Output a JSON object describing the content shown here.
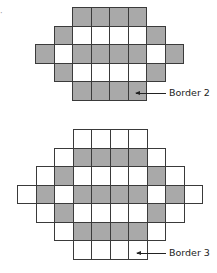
{
  "figures": [
    {
      "id": "border-2",
      "label": "Border 2",
      "origin": {
        "x": 35,
        "y": 7
      },
      "cell_size": 18.5,
      "rows": [
        [
          null,
          null,
          "g",
          "g",
          "g",
          "g",
          null,
          null
        ],
        [
          null,
          "g",
          "w",
          "w",
          "w",
          "w",
          "g",
          null
        ],
        [
          "g",
          "w",
          "g",
          "g",
          "g",
          "g",
          "w",
          "g"
        ],
        [
          null,
          "g",
          "w",
          "w",
          "w",
          "w",
          "g",
          null
        ],
        [
          null,
          null,
          "g",
          "g",
          "g",
          "g",
          null,
          null
        ]
      ],
      "arrow": {
        "x": 136,
        "y": 93,
        "width": 30
      },
      "label_pos": {
        "x": 169,
        "y": 87
      }
    },
    {
      "id": "border-3",
      "label": "Border 3",
      "origin": {
        "x": 17,
        "y": 129
      },
      "cell_size": 18.5,
      "rows": [
        [
          null,
          null,
          null,
          "w",
          "w",
          "w",
          "w",
          null,
          null,
          null
        ],
        [
          null,
          null,
          "w",
          "g",
          "g",
          "g",
          "g",
          "w",
          null,
          null
        ],
        [
          null,
          "w",
          "g",
          "w",
          "w",
          "w",
          "w",
          "g",
          "w",
          null
        ],
        [
          "w",
          "g",
          "w",
          "g",
          "g",
          "g",
          "g",
          "w",
          "g",
          "w"
        ],
        [
          null,
          "w",
          "g",
          "w",
          "w",
          "w",
          "w",
          "g",
          "w",
          null
        ],
        [
          null,
          null,
          "w",
          "g",
          "g",
          "g",
          "g",
          "w",
          null,
          null
        ],
        [
          null,
          null,
          null,
          "w",
          "w",
          "w",
          "w",
          null,
          null,
          null
        ]
      ],
      "arrow": {
        "x": 137,
        "y": 253,
        "width": 29
      },
      "label_pos": {
        "x": 169,
        "y": 247
      }
    }
  ],
  "colors": {
    "gray": "#a9a9a9",
    "white": "#ffffff",
    "line": "#3a3a3a"
  }
}
